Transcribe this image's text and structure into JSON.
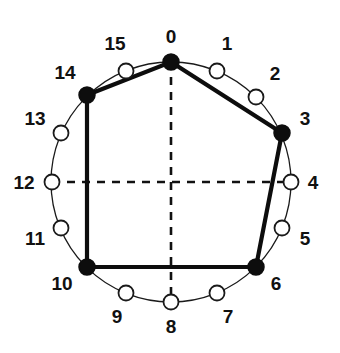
{
  "diagram": {
    "type": "circular-node-graph",
    "total_positions": 16,
    "center": {
      "x": 171,
      "y": 182
    },
    "radius": 120,
    "colors": {
      "stroke": "#0d0d0d",
      "node_fill_marked": "#0d0d0d",
      "node_fill_unmarked": "#ffffff",
      "background": "#ffffff"
    },
    "axes": {
      "vertical": {
        "from_label": "0",
        "to_label": "8",
        "style": "dashed"
      },
      "horizontal": {
        "from_label": "12",
        "to_label": "4",
        "style": "dashed"
      }
    },
    "polygon": {
      "vertices": [
        0,
        3,
        6,
        10,
        14
      ],
      "closed": true,
      "edge_style": "thick-solid"
    },
    "nodes": [
      {
        "index": 0,
        "label": "0",
        "marked": true,
        "cx": 171,
        "cy": 62,
        "lx": 171,
        "ly": 38
      },
      {
        "index": 1,
        "label": "1",
        "marked": false,
        "cx": 217,
        "cy": 71,
        "lx": 227,
        "ly": 45
      },
      {
        "index": 2,
        "label": "2",
        "marked": false,
        "cx": 256,
        "cy": 97,
        "lx": 275,
        "ly": 75
      },
      {
        "index": 3,
        "label": "3",
        "marked": true,
        "cx": 282,
        "cy": 133,
        "lx": 305,
        "ly": 120
      },
      {
        "index": 4,
        "label": "4",
        "marked": false,
        "cx": 291,
        "cy": 182,
        "lx": 313,
        "ly": 184
      },
      {
        "index": 5,
        "label": "5",
        "marked": false,
        "cx": 282,
        "cy": 228,
        "lx": 305,
        "ly": 240
      },
      {
        "index": 6,
        "label": "6",
        "marked": true,
        "cx": 256,
        "cy": 267,
        "lx": 276,
        "ly": 285
      },
      {
        "index": 7,
        "label": "7",
        "marked": false,
        "cx": 217,
        "cy": 293,
        "lx": 228,
        "ly": 318
      },
      {
        "index": 8,
        "label": "8",
        "marked": false,
        "cx": 171,
        "cy": 302,
        "lx": 171,
        "ly": 328
      },
      {
        "index": 9,
        "label": "9",
        "marked": false,
        "cx": 126,
        "cy": 293,
        "lx": 117,
        "ly": 318
      },
      {
        "index": 10,
        "label": "10",
        "marked": true,
        "cx": 87,
        "cy": 267,
        "lx": 62,
        "ly": 285
      },
      {
        "index": 11,
        "label": "11",
        "marked": false,
        "cx": 61,
        "cy": 228,
        "lx": 35,
        "ly": 240
      },
      {
        "index": 12,
        "label": "12",
        "marked": false,
        "cx": 52,
        "cy": 182,
        "lx": 24,
        "ly": 184
      },
      {
        "index": 13,
        "label": "13",
        "marked": false,
        "cx": 61,
        "cy": 133,
        "lx": 35,
        "ly": 120
      },
      {
        "index": 14,
        "label": "14",
        "marked": true,
        "cx": 87,
        "cy": 95,
        "lx": 65,
        "ly": 74
      },
      {
        "index": 15,
        "label": "15",
        "marked": false,
        "cx": 126,
        "cy": 71,
        "lx": 115,
        "ly": 45
      }
    ]
  }
}
